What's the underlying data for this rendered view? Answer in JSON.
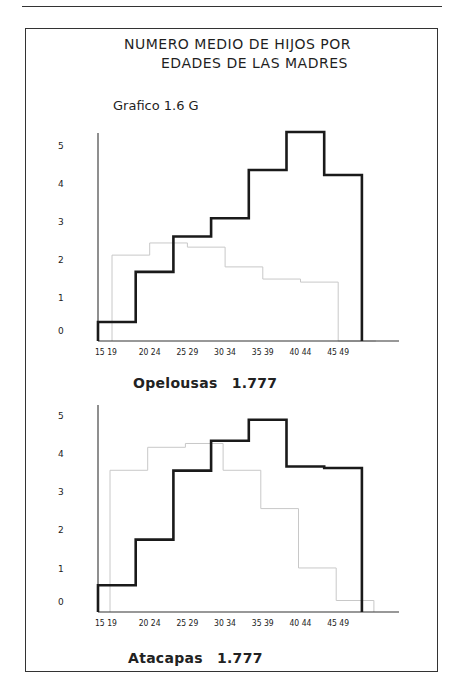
{
  "page": {
    "header_text": "",
    "title_line1": "NUMERO  MEDIO DE HIJOS POR",
    "title_line2": "EDADES  DE LAS  MADRES",
    "subtitle": "Grafico 1.6 G"
  },
  "colors": {
    "primary_series": "#1a1a1a",
    "ghost_series": "#c8c8c8",
    "frame": "#333333"
  },
  "chart_data": [
    {
      "type": "bar",
      "style": "step-histogram",
      "title": "Opelousas",
      "caption_value": "1.777",
      "xlabel": "",
      "ylabel": "",
      "ylim": [
        0,
        5.6
      ],
      "yticks": [
        "0",
        "1",
        "2",
        "3",
        "4",
        "5"
      ],
      "categories": [
        "15 19",
        "20 24",
        "25 29",
        "30 34",
        "35 39",
        "40 44",
        "45 49"
      ],
      "grid": false,
      "series": [
        {
          "name": "Opelousas",
          "values": [
            0.5,
            1.82,
            2.75,
            3.23,
            4.5,
            5.5,
            4.37
          ]
        },
        {
          "name": "show-through (faint)",
          "values": [
            2.26,
            2.58,
            2.47,
            1.95,
            1.63,
            1.55,
            0.0
          ]
        }
      ]
    },
    {
      "type": "bar",
      "style": "step-histogram",
      "title": "Atacapas",
      "caption_value": "1.777",
      "xlabel": "",
      "ylabel": "",
      "ylim": [
        0,
        5.6
      ],
      "yticks": [
        "0",
        "1",
        "2",
        "3",
        "4",
        "5"
      ],
      "categories": [
        "15 19",
        "20 24",
        "25 29",
        "30 34",
        "35 39",
        "40 44",
        "45 49"
      ],
      "grid": false,
      "series": [
        {
          "name": "Atacapas",
          "values": [
            0.7,
            1.89,
            3.69,
            4.47,
            5.02,
            3.8,
            3.76
          ]
        },
        {
          "name": "show-through (faint)",
          "values": [
            3.7,
            4.3,
            4.4,
            3.7,
            2.7,
            1.15,
            0.3
          ]
        }
      ]
    }
  ]
}
